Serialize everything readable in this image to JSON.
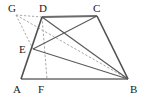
{
  "figure": {
    "background_color": "#ffffff",
    "stroke_color": "#4d4d4d",
    "solid_color": "#555555",
    "dashed_color": "#9a9a9a",
    "label_color": "#1a1a1a",
    "width": 148,
    "height": 97
  },
  "points": {
    "A": {
      "label": "A",
      "x": 21,
      "y": 79,
      "label_x": 13,
      "label_y": 92
    },
    "B": {
      "label": "B",
      "x": 128,
      "y": 79,
      "label_x": 130,
      "label_y": 93
    },
    "C": {
      "label": "C",
      "x": 97,
      "y": 16,
      "label_x": 94,
      "label_y": 12
    },
    "D": {
      "label": "D",
      "x": 42,
      "y": 17,
      "label_x": 40,
      "label_y": 12
    },
    "E": {
      "label": "E",
      "x": 33,
      "y": 49,
      "label_x": 19,
      "label_y": 53
    },
    "F": {
      "label": "F",
      "x": 47,
      "y": 79,
      "label_x": 37,
      "label_y": 93
    },
    "G": {
      "label": "G",
      "x": 16,
      "y": 15,
      "label_x": 8,
      "label_y": 12
    }
  },
  "solid_segments": [
    {
      "name": "AB",
      "from": "A",
      "to": "B"
    },
    {
      "name": "AD",
      "from": "A",
      "to": "D"
    },
    {
      "name": "DC",
      "from": "D",
      "to": "C"
    },
    {
      "name": "CB",
      "from": "C",
      "to": "B"
    },
    {
      "name": "DB",
      "from": "D",
      "to": "B"
    },
    {
      "name": "EC",
      "from": "E",
      "to": "C"
    },
    {
      "name": "EB",
      "from": "E",
      "to": "B"
    }
  ],
  "dashed_segments": [
    {
      "name": "GD",
      "from": "G",
      "to": "D"
    },
    {
      "name": "GE",
      "from": "G",
      "to": "E"
    },
    {
      "name": "GB",
      "from": "G",
      "to": "B"
    },
    {
      "name": "DF",
      "from": "D",
      "to": "F"
    }
  ],
  "labels": [
    "A",
    "B",
    "C",
    "D",
    "E",
    "F",
    "G"
  ]
}
